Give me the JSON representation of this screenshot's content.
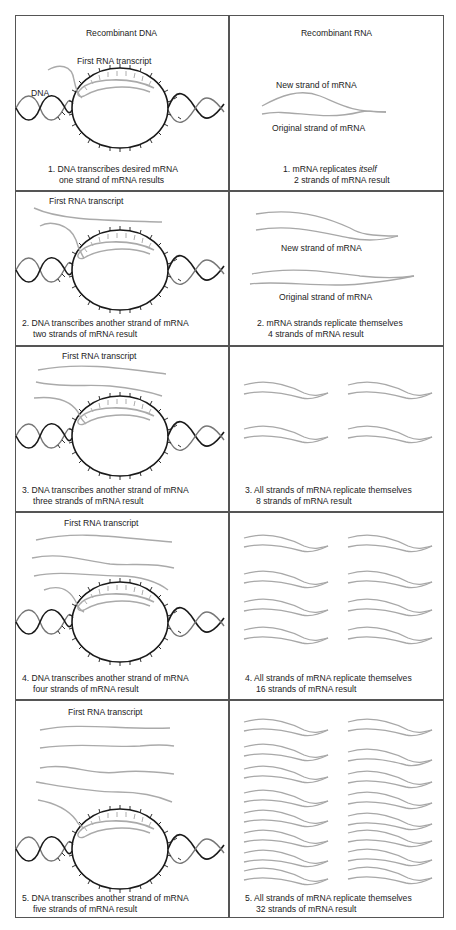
{
  "headers": {
    "left": "Recombinant DNA",
    "right": "Recombinant RNA"
  },
  "labels": {
    "dna": "DNA",
    "first_rna_transcript": "First RNA transcript",
    "new_strand": "New strand of mRNA",
    "original_strand": "Original strand of mRNA"
  },
  "rows": [
    {
      "dna_caption_line1": "1.  DNA transcribes desired mRNA",
      "dna_caption_line2": "one strand of mRNA results",
      "rna_caption_line1_prefix": "1.  mRNA replicates ",
      "rna_caption_line1_italic": "itself",
      "rna_caption_line2": "2 strands of mRNA result"
    },
    {
      "dna_caption_line1": "2.  DNA transcribes another strand of mRNA",
      "dna_caption_line2": "two strands of mRNA result",
      "rna_caption_line1": "2.  mRNA strands replicate themselves",
      "rna_caption_line2": "4 strands of mRNA result"
    },
    {
      "dna_caption_line1": "3.  DNA transcribes another strand of mRNA",
      "dna_caption_line2": "three strands of mRNA result",
      "rna_caption_line1": "3.  All strands of mRNA replicate themselves",
      "rna_caption_line2": "8 strands of mRNA result"
    },
    {
      "dna_caption_line1": "4.  DNA transcribes another strand of mRNA",
      "dna_caption_line2": "four strands of mRNA result",
      "rna_caption_line1": "4.  All strands of mRNA replicate themselves",
      "rna_caption_line2": "16 strands of mRNA result"
    },
    {
      "dna_caption_line1": "5.  DNA transcribes another strand of mRNA",
      "dna_caption_line2": "five strands of mRNA result",
      "rna_caption_line1": "5.  All strands of mRNA replicate themselves",
      "rna_caption_line2": "32 strands of mRNA result"
    }
  ],
  "colors": {
    "dna_strand": "#1a1a1a",
    "dna_second_strand": "#777777",
    "rna_strand": "#a8a8a8",
    "border": "#555555"
  }
}
